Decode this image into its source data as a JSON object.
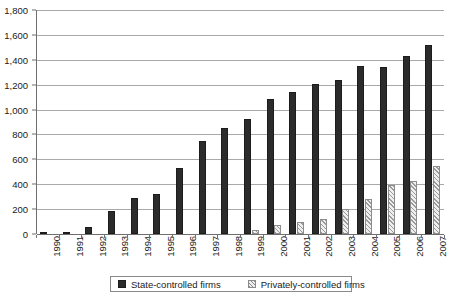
{
  "chart_data": {
    "type": "bar",
    "title": "",
    "xlabel": "",
    "ylabel": "",
    "ylim": [
      0,
      1800
    ],
    "ytick_step": 200,
    "grid": true,
    "legend_position": "bottom",
    "categories": [
      "1990",
      "1991",
      "1992",
      "1993",
      "1994",
      "1995",
      "1996",
      "1997",
      "1998",
      "1999",
      "2000",
      "2001",
      "2002",
      "2003",
      "2004",
      "2005",
      "2006",
      "2007"
    ],
    "ytick_labels": [
      "0",
      "200",
      "400",
      "600",
      "800",
      "1,000",
      "1,200",
      "1,400",
      "1,600",
      "1,800"
    ],
    "ytick_values": [
      0,
      200,
      400,
      600,
      800,
      1000,
      1200,
      1400,
      1600,
      1800
    ],
    "series": [
      {
        "name": "State-controlled firms",
        "marker": "filled-square",
        "color": "#2b2b2b",
        "pattern": "dotted-fill",
        "values": [
          10,
          14,
          53,
          183,
          291,
          323,
          530,
          745,
          851,
          924,
          1088,
          1140,
          1202,
          1241,
          1350,
          1345,
          1431,
          1522
        ]
      },
      {
        "name": "Privately-controlled firms",
        "marker": "hatched-square",
        "color": "#efefef",
        "pattern": "diagonal-hatch",
        "values": [
          0,
          0,
          0,
          0,
          0,
          0,
          0,
          0,
          0,
          30,
          75,
          96,
          124,
          205,
          281,
          390,
          430,
          545
        ]
      }
    ]
  },
  "legend": {
    "entries": [
      {
        "label": "State-controlled firms"
      },
      {
        "label": "Privately-controlled firms"
      }
    ]
  },
  "caption": {
    "text": ""
  }
}
